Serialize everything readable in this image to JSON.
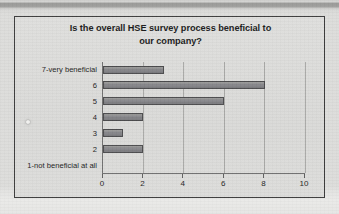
{
  "page": {
    "background_color": "#dcdcda",
    "top_band_color": "#9a9a98",
    "frame_border_color": "#3b3b3b"
  },
  "chart_data": {
    "type": "bar",
    "orientation": "horizontal",
    "title": "Is the overall HSE survey process beneficial to our company?",
    "title_line_1": "Is the overall HSE survey process beneficial to",
    "title_line_2": "our company?",
    "xlabel": "",
    "ylabel": "",
    "categories": [
      "7-very beneficial",
      "6",
      "5",
      "4",
      "3",
      "2",
      "1-not beneficial at all"
    ],
    "values": [
      3,
      8,
      6,
      2,
      1,
      2,
      0
    ],
    "xlim": [
      0,
      10
    ],
    "xticks": [
      0,
      2,
      4,
      6,
      8,
      10
    ],
    "xtick_labels": [
      "0",
      "2",
      "4",
      "6",
      "8",
      "10"
    ],
    "grid": true,
    "grid_axis": "x",
    "legend": false,
    "bar_color": "#86868a",
    "bar_border_color": "#4a4a4c",
    "gridline_color": "#a9a9a7",
    "axis_color": "#6e6e6e"
  }
}
